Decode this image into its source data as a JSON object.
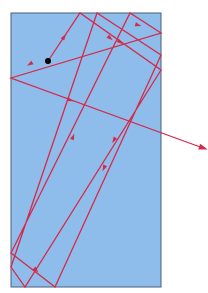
{
  "diagram": {
    "colors": {
      "background": "#ffffff",
      "block_fill": "#8fbdeb",
      "block_stroke": "#4a5f78",
      "ray": "#d42a4a",
      "source_dot": "#000000"
    },
    "block": {
      "x": 11,
      "y": 13,
      "width": 150,
      "height": 274
    },
    "source": {
      "x": 48,
      "y": 61,
      "r": 3
    },
    "ray_path": [
      [
        48,
        61
      ],
      [
        80,
        13
      ],
      [
        161,
        70
      ],
      [
        25,
        287
      ],
      [
        11,
        267
      ],
      [
        97,
        13
      ],
      [
        161,
        55
      ],
      [
        55,
        287
      ],
      [
        11,
        253
      ],
      [
        130,
        13
      ],
      [
        161,
        33
      ],
      [
        11,
        78
      ],
      [
        203,
        148
      ]
    ],
    "arrows": [
      [
        64,
        37,
        -0.98
      ],
      [
        30,
        64,
        2.6
      ],
      [
        120,
        42,
        0.62
      ],
      [
        70,
        100,
        0.33
      ],
      [
        114,
        140,
        2.13
      ],
      [
        104,
        168,
        1.99
      ],
      [
        36,
        270,
        0.82
      ],
      [
        73,
        137,
        -1.2
      ],
      [
        110,
        38,
        0.7
      ],
      [
        138,
        25,
        0.3
      ]
    ],
    "exit_arrowhead": {
      "x": 203,
      "y": 148,
      "angle": 0.33
    }
  }
}
